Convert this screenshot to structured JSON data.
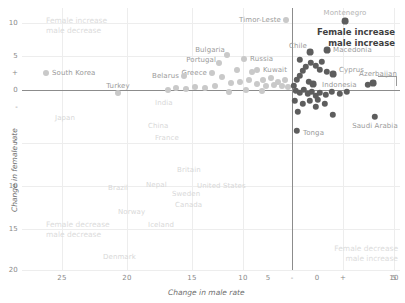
{
  "chart_data": {
    "type": "scatter",
    "title": "",
    "xlabel": "Change in male rate",
    "ylabel": "Change in female rate",
    "xticks": [
      "25",
      "20",
      "15",
      "10",
      "5",
      "-",
      "0",
      "+",
      "5",
      "10"
    ],
    "yticks": [
      "10",
      "5",
      "+",
      "0",
      "-",
      "5",
      "10",
      "15",
      "20"
    ],
    "xlim": [
      -27,
      11
    ],
    "ylim": [
      -21,
      11
    ],
    "grid": true,
    "legend": "none",
    "colors": {
      "marker_left": "#c9c9c9",
      "marker_right": "#5d5d5d",
      "axis": "#8c8c8c",
      "grid": "#ededed",
      "label": "#b4b4b4",
      "quadrant_faint": "#dcdcdc",
      "quadrant_strong": "#3f3f3f"
    },
    "annotations": [
      {
        "text_line1": "Female increase",
        "text_line2": "male decrease",
        "quadrant": "top-left",
        "emphasis": "faint"
      },
      {
        "text_line1": "Female increase",
        "text_line2": "male increase",
        "quadrant": "top-right",
        "emphasis": "bold"
      },
      {
        "text_line1": "Female decrease",
        "text_line2": "male decrease",
        "quadrant": "bottom-left",
        "emphasis": "faint"
      },
      {
        "text_line1": "Female decrease",
        "text_line2": "male increase",
        "quadrant": "bottom-right",
        "emphasis": "faint"
      }
    ],
    "points": [
      {
        "name": "South Korea",
        "px": 46,
        "py": 73,
        "side": "left",
        "r": 3.0,
        "label_x": 52,
        "label_y": 73,
        "label_align": "left",
        "label_tone": "mid"
      },
      {
        "name": "Turkey",
        "px": 118,
        "py": 93,
        "side": "left",
        "r": 3.0,
        "label_x": 118,
        "label_y": 86,
        "label_align": "center",
        "label_tone": "mid"
      },
      {
        "name": "Timor-Leste",
        "px": 286,
        "py": 20,
        "side": "left",
        "r": 3.0,
        "label_x": 281,
        "label_y": 20,
        "label_align": "right",
        "label_tone": "mid"
      },
      {
        "name": "Bulgaria",
        "px": 227,
        "py": 55,
        "side": "left",
        "r": 3.0,
        "label_x": 225,
        "label_y": 50,
        "label_align": "right",
        "label_tone": "mid"
      },
      {
        "name": "Portugal",
        "px": 219,
        "py": 63,
        "side": "left",
        "r": 3.0,
        "label_x": 216,
        "label_y": 60,
        "label_align": "right",
        "label_tone": "mid"
      },
      {
        "name": "Russia",
        "px": 244,
        "py": 59,
        "side": "left",
        "r": 3.0,
        "label_x": 250,
        "label_y": 59,
        "label_align": "left",
        "label_tone": "mid"
      },
      {
        "name": "Kuwait",
        "px": 257,
        "py": 70,
        "side": "left",
        "r": 3.0,
        "label_x": 263,
        "label_y": 70,
        "label_align": "left",
        "label_tone": "mid"
      },
      {
        "name": "Greece",
        "px": 212,
        "py": 73,
        "side": "left",
        "r": 3.0,
        "label_x": 207,
        "label_y": 73,
        "label_align": "right",
        "label_tone": "mid"
      },
      {
        "name": "Belarus",
        "px": 184,
        "py": 76,
        "side": "left",
        "r": 3.0,
        "label_x": 179,
        "label_y": 76,
        "label_align": "right",
        "label_tone": "mid"
      },
      {
        "name": "Montenegro",
        "px": 345,
        "py": 21,
        "side": "right",
        "r": 3.4,
        "label_x": 345,
        "label_y": 13,
        "label_align": "center",
        "label_tone": "label"
      },
      {
        "name": "Chile",
        "px": 310,
        "py": 52,
        "side": "right",
        "r": 3.4,
        "label_x": 307,
        "label_y": 46,
        "label_align": "right",
        "label_tone": "mid"
      },
      {
        "name": "Macedonia",
        "px": 327,
        "py": 50,
        "side": "right",
        "r": 3.4,
        "label_x": 333,
        "label_y": 50,
        "label_align": "left",
        "label_tone": "mid"
      },
      {
        "name": "Cyprus",
        "px": 333,
        "py": 74,
        "side": "right",
        "r": 3.4,
        "label_x": 339,
        "label_y": 70,
        "label_align": "left",
        "label_tone": "mid"
      },
      {
        "name": "Indonesia",
        "px": 313,
        "py": 84,
        "side": "right",
        "r": 3.4,
        "label_x": 322,
        "label_y": 85,
        "label_align": "left",
        "label_tone": "mid"
      },
      {
        "name": "Azerbaijan",
        "px": 373,
        "py": 83,
        "side": "right",
        "r": 3.4,
        "label_x": 397,
        "label_y": 74,
        "label_align": "right",
        "label_tone": "mid"
      },
      {
        "name": "Tonga",
        "px": 297,
        "py": 131,
        "side": "right",
        "r": 3.2,
        "label_x": 303,
        "label_y": 133,
        "label_align": "left",
        "label_tone": "mid"
      },
      {
        "name": "Saudi Arabia",
        "px": 375,
        "py": 117,
        "side": "right",
        "r": 3.2,
        "label_x": 375,
        "label_y": 126,
        "label_align": "center",
        "label_tone": "mid"
      },
      {
        "name": "India",
        "px": 0,
        "py": 0,
        "side": "none",
        "r": 0,
        "label_x": 155,
        "label_y": 103,
        "label_align": "left",
        "label_tone": "faint"
      },
      {
        "name": "Japan",
        "px": 0,
        "py": 0,
        "side": "none",
        "r": 0,
        "label_x": 55,
        "label_y": 118,
        "label_align": "left",
        "label_tone": "faint"
      },
      {
        "name": "China",
        "px": 0,
        "py": 0,
        "side": "none",
        "r": 0,
        "label_x": 148,
        "label_y": 126,
        "label_align": "left",
        "label_tone": "faint"
      },
      {
        "name": "France",
        "px": 0,
        "py": 0,
        "side": "none",
        "r": 0,
        "label_x": 155,
        "label_y": 138,
        "label_align": "left",
        "label_tone": "faint"
      },
      {
        "name": "Britain",
        "px": 0,
        "py": 0,
        "side": "none",
        "r": 0,
        "label_x": 177,
        "label_y": 170,
        "label_align": "left",
        "label_tone": "faint"
      },
      {
        "name": "Brazil",
        "px": 0,
        "py": 0,
        "side": "none",
        "r": 0,
        "label_x": 108,
        "label_y": 188,
        "label_align": "left",
        "label_tone": "faint"
      },
      {
        "name": "Nepal",
        "px": 0,
        "py": 0,
        "side": "none",
        "r": 0,
        "label_x": 146,
        "label_y": 185,
        "label_align": "left",
        "label_tone": "faint"
      },
      {
        "name": "United States",
        "px": 0,
        "py": 0,
        "side": "none",
        "r": 0,
        "label_x": 197,
        "label_y": 186,
        "label_align": "left",
        "label_tone": "faint"
      },
      {
        "name": "Sweden",
        "px": 0,
        "py": 0,
        "side": "none",
        "r": 0,
        "label_x": 172,
        "label_y": 194,
        "label_align": "left",
        "label_tone": "faint"
      },
      {
        "name": "Canada",
        "px": 0,
        "py": 0,
        "side": "none",
        "r": 0,
        "label_x": 175,
        "label_y": 205,
        "label_align": "left",
        "label_tone": "faint"
      },
      {
        "name": "Norway",
        "px": 0,
        "py": 0,
        "side": "none",
        "r": 0,
        "label_x": 118,
        "label_y": 212,
        "label_align": "left",
        "label_tone": "faint"
      },
      {
        "name": "Iceland",
        "px": 0,
        "py": 0,
        "side": "none",
        "r": 0,
        "label_x": 148,
        "label_y": 225,
        "label_align": "left",
        "label_tone": "faint"
      },
      {
        "name": "Denmark",
        "px": 0,
        "py": 0,
        "side": "none",
        "r": 0,
        "label_x": 103,
        "label_y": 257,
        "label_align": "left",
        "label_tone": "faint"
      }
    ],
    "unlabeled_points": [
      {
        "px": 231,
        "py": 83,
        "side": "left",
        "r": 3.0
      },
      {
        "px": 240,
        "py": 82,
        "side": "left",
        "r": 3.0
      },
      {
        "px": 249,
        "py": 80,
        "side": "left",
        "r": 3.0
      },
      {
        "px": 257,
        "py": 84,
        "side": "left",
        "r": 3.0
      },
      {
        "px": 263,
        "py": 80,
        "side": "left",
        "r": 3.0
      },
      {
        "px": 266,
        "py": 86,
        "side": "left",
        "r": 3.0
      },
      {
        "px": 271,
        "py": 78,
        "side": "left",
        "r": 3.0
      },
      {
        "px": 274,
        "py": 85,
        "side": "left",
        "r": 3.0
      },
      {
        "px": 278,
        "py": 82,
        "side": "left",
        "r": 3.0
      },
      {
        "px": 282,
        "py": 86,
        "side": "left",
        "r": 3.0
      },
      {
        "px": 285,
        "py": 80,
        "side": "left",
        "r": 3.0
      },
      {
        "px": 288,
        "py": 87,
        "side": "left",
        "r": 3.0
      },
      {
        "px": 215,
        "py": 86,
        "side": "left",
        "r": 3.0
      },
      {
        "px": 205,
        "py": 88,
        "side": "left",
        "r": 3.0
      },
      {
        "px": 195,
        "py": 87,
        "side": "left",
        "r": 3.0
      },
      {
        "px": 186,
        "py": 89,
        "side": "left",
        "r": 3.0
      },
      {
        "px": 176,
        "py": 88,
        "side": "left",
        "r": 3.0
      },
      {
        "px": 168,
        "py": 90,
        "side": "left",
        "r": 3.0
      },
      {
        "px": 252,
        "py": 72,
        "side": "left",
        "r": 3.0
      },
      {
        "px": 237,
        "py": 70,
        "side": "left",
        "r": 3.0
      },
      {
        "px": 222,
        "py": 77,
        "side": "left",
        "r": 3.0
      },
      {
        "px": 246,
        "py": 90,
        "side": "left",
        "r": 3.0
      },
      {
        "px": 262,
        "py": 91,
        "side": "left",
        "r": 3.0
      },
      {
        "px": 229,
        "py": 92,
        "side": "left",
        "r": 3.0
      },
      {
        "px": 294,
        "py": 86,
        "side": "right",
        "r": 3.2
      },
      {
        "px": 297,
        "py": 80,
        "side": "right",
        "r": 3.2
      },
      {
        "px": 300,
        "py": 76,
        "side": "right",
        "r": 3.2
      },
      {
        "px": 303,
        "py": 71,
        "side": "right",
        "r": 3.2
      },
      {
        "px": 306,
        "py": 67,
        "side": "right",
        "r": 3.2
      },
      {
        "px": 311,
        "py": 63,
        "side": "right",
        "r": 3.2
      },
      {
        "px": 316,
        "py": 66,
        "side": "right",
        "r": 3.2
      },
      {
        "px": 320,
        "py": 70,
        "side": "right",
        "r": 3.2
      },
      {
        "px": 322,
        "py": 62,
        "side": "right",
        "r": 3.2
      },
      {
        "px": 327,
        "py": 72,
        "side": "right",
        "r": 3.2
      },
      {
        "px": 296,
        "py": 91,
        "side": "right",
        "r": 3.2
      },
      {
        "px": 300,
        "py": 93,
        "side": "right",
        "r": 3.2
      },
      {
        "px": 304,
        "py": 90,
        "side": "right",
        "r": 3.2
      },
      {
        "px": 308,
        "py": 94,
        "side": "right",
        "r": 3.2
      },
      {
        "px": 312,
        "py": 92,
        "side": "right",
        "r": 3.2
      },
      {
        "px": 316,
        "py": 96,
        "side": "right",
        "r": 3.2
      },
      {
        "px": 320,
        "py": 93,
        "side": "right",
        "r": 3.2
      },
      {
        "px": 326,
        "py": 95,
        "side": "right",
        "r": 3.2
      },
      {
        "px": 332,
        "py": 92,
        "side": "right",
        "r": 3.2
      },
      {
        "px": 340,
        "py": 94,
        "side": "right",
        "r": 3.2
      },
      {
        "px": 347,
        "py": 92,
        "side": "right",
        "r": 3.2
      },
      {
        "px": 368,
        "py": 85,
        "side": "right",
        "r": 3.2
      },
      {
        "px": 295,
        "py": 101,
        "side": "right",
        "r": 3.2
      },
      {
        "px": 303,
        "py": 104,
        "side": "right",
        "r": 3.2
      },
      {
        "px": 310,
        "py": 101,
        "side": "right",
        "r": 3.2
      },
      {
        "px": 316,
        "py": 107,
        "side": "right",
        "r": 3.2
      },
      {
        "px": 318,
        "py": 100,
        "side": "right",
        "r": 3.2
      },
      {
        "px": 325,
        "py": 104,
        "side": "right",
        "r": 3.2
      },
      {
        "px": 333,
        "py": 115,
        "side": "right",
        "r": 3.2
      },
      {
        "px": 298,
        "py": 112,
        "side": "right",
        "r": 3.2
      },
      {
        "px": 309,
        "py": 82,
        "side": "right",
        "r": 3.2
      },
      {
        "px": 300,
        "py": 60,
        "side": "right",
        "r": 3.2
      }
    ]
  }
}
